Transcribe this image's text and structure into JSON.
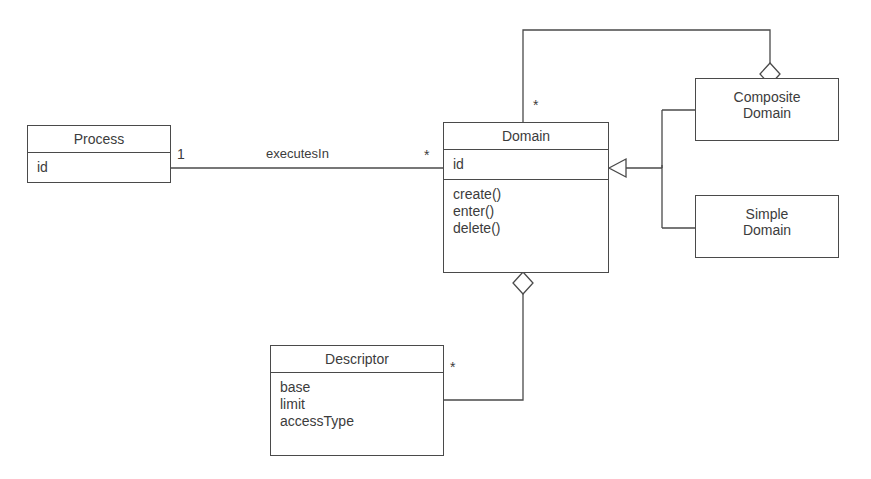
{
  "diagram": {
    "kind": "uml-class-diagram",
    "background_color": "#ffffff",
    "line_color": "#4a4a4a",
    "text_color": "#3c3c3c"
  },
  "classes": {
    "process": {
      "name": "Process",
      "attributes": [
        "id"
      ],
      "operations": []
    },
    "domain": {
      "name": "Domain",
      "attributes": [
        "id"
      ],
      "operations": [
        "create()",
        "enter()",
        "delete()"
      ]
    },
    "composite_domain": {
      "name": "Composite\nDomain",
      "attributes": [],
      "operations": []
    },
    "simple_domain": {
      "name": "Simple\nDomain",
      "attributes": [],
      "operations": []
    },
    "descriptor": {
      "name": "Descriptor",
      "attributes": [
        "base",
        "limit",
        "accessType"
      ],
      "operations": []
    }
  },
  "relationships": {
    "executes_in": {
      "label": "executesIn",
      "source_multiplicity": "1",
      "target_multiplicity": "*",
      "type": "association"
    },
    "composite_contains_domain": {
      "label": "",
      "source_multiplicity": "*",
      "target_multiplicity": "",
      "type": "aggregation"
    },
    "domain_has_descriptor": {
      "label": "",
      "source_multiplicity": "*",
      "target_multiplicity": "",
      "type": "aggregation"
    },
    "composite_generalizes_domain": {
      "type": "generalization"
    },
    "simple_generalizes_domain": {
      "type": "generalization"
    }
  },
  "multiplicity_labels": {
    "process_end": "1",
    "domain_association_end": "*",
    "domain_top_end": "*",
    "descriptor_end": "*"
  }
}
